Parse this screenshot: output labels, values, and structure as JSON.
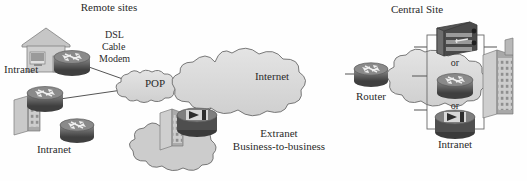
{
  "diagram": {
    "title_hidden": "",
    "background_color": "#fefefe",
    "ink_color": "#3a3a3a",
    "device_dark": "#4b4b4b",
    "device_mid": "#6e6e6e",
    "cloud_fill": "#d9d9d9",
    "cloud_stroke": "#6b6b6b",
    "building_fill": "#c3c3c3",
    "line_color": "#555555"
  },
  "labels": {
    "remote_sites": "Remote sites",
    "dsl": "DSL",
    "cable": "Cable",
    "modem": "Modem",
    "intranet_home": "Intranet",
    "intranet_branch": "Intranet",
    "pop": "POP",
    "internet": "Internet",
    "extranet": "Extranet",
    "business_to_business": "Business-to-business",
    "router": "Router",
    "central_site": "Central Site",
    "or_top": "or",
    "or_bottom": "or",
    "intranet_central": "Intranet"
  },
  "nodes": [
    {
      "id": "home-router",
      "type": "router-icon",
      "label": "",
      "x": 72,
      "y": 63
    },
    {
      "id": "house",
      "type": "house-icon",
      "label": "Intranet",
      "x": 40,
      "y": 52
    },
    {
      "id": "branch-router",
      "type": "router-icon",
      "label": "",
      "x": 45,
      "y": 100
    },
    {
      "id": "branch-building",
      "type": "building-icon",
      "label": "",
      "x": 24,
      "y": 110
    },
    {
      "id": "intranet-router",
      "type": "router-icon",
      "label": "Intranet",
      "x": 77,
      "y": 130
    },
    {
      "id": "pop-cloud",
      "type": "cloud",
      "label": "POP",
      "x": 155,
      "y": 84
    },
    {
      "id": "internet-cloud",
      "type": "cloud",
      "label": "Internet",
      "x": 272,
      "y": 75
    },
    {
      "id": "extranet-cloud",
      "type": "cloud",
      "label": "Extranet",
      "x": 192,
      "y": 143
    },
    {
      "id": "extranet-firewall",
      "type": "firewall-icon",
      "label": "",
      "x": 197,
      "y": 124
    },
    {
      "id": "extranet-building",
      "type": "building-icon",
      "label": "",
      "x": 170,
      "y": 128
    },
    {
      "id": "edge-router",
      "type": "router-icon",
      "label": "Router",
      "x": 371,
      "y": 76
    },
    {
      "id": "central-cloud",
      "type": "cloud",
      "label": "",
      "x": 452,
      "y": 85
    },
    {
      "id": "central-switch",
      "type": "switch-icon",
      "label": "",
      "x": 455,
      "y": 40
    },
    {
      "id": "central-router",
      "type": "router-icon",
      "label": "",
      "x": 455,
      "y": 87
    },
    {
      "id": "central-firewall",
      "type": "firewall-icon",
      "label": "Intranet",
      "x": 455,
      "y": 126
    },
    {
      "id": "central-building",
      "type": "building-icon",
      "label": "",
      "x": 495,
      "y": 75
    }
  ],
  "links": [
    {
      "from": "home-router",
      "to": "pop-cloud"
    },
    {
      "from": "branch-router",
      "to": "pop-cloud"
    },
    {
      "from": "pop-cloud",
      "to": "internet-cloud"
    },
    {
      "from": "extranet-firewall",
      "to": "internet-cloud"
    },
    {
      "from": "internet-cloud",
      "to": "edge-router"
    },
    {
      "from": "edge-router",
      "to": "central-cloud"
    }
  ]
}
